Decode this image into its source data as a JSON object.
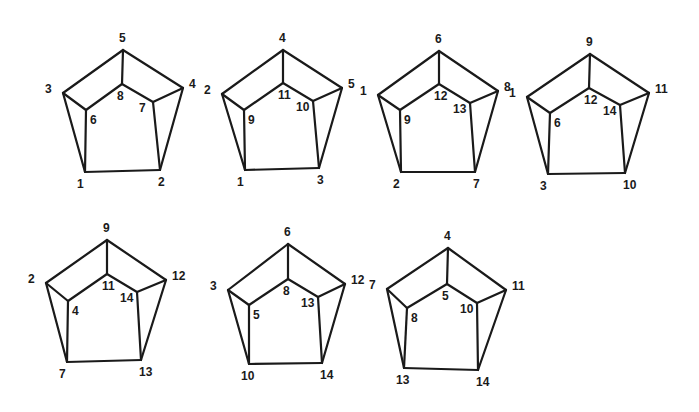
{
  "diagram": {
    "vertex_roles": [
      "top",
      "left",
      "right",
      "inner_top",
      "inner_left",
      "inner_right",
      "bottom_left",
      "bottom_right"
    ],
    "edges": [
      [
        "top",
        "left"
      ],
      [
        "top",
        "right"
      ],
      [
        "top",
        "inner_top"
      ],
      [
        "left",
        "inner_left"
      ],
      [
        "right",
        "inner_right"
      ],
      [
        "inner_top",
        "inner_left"
      ],
      [
        "inner_top",
        "inner_right"
      ],
      [
        "left",
        "bottom_left"
      ],
      [
        "inner_left",
        "bottom_left"
      ],
      [
        "right",
        "bottom_right"
      ],
      [
        "inner_right",
        "bottom_right"
      ],
      [
        "bottom_left",
        "bottom_right"
      ]
    ],
    "figures": [
      {
        "id": "fig-1",
        "labels": {
          "top": "5",
          "left": "3",
          "right": "4",
          "inner_top": "8",
          "inner_left": "6",
          "inner_right": "7",
          "bottom_left": "1",
          "bottom_right": "2"
        },
        "pts": {
          "top": [
            123,
            50
          ],
          "left": [
            63,
            93
          ],
          "right": [
            183,
            88
          ],
          "inner_top": [
            122,
            84
          ],
          "inner_left": [
            86,
            110
          ],
          "inner_right": [
            153,
            102
          ],
          "bottom_left": [
            85,
            172
          ],
          "bottom_right": [
            160,
            170
          ]
        }
      },
      {
        "id": "fig-2",
        "labels": {
          "top": "4",
          "left": "2",
          "right": "5",
          "inner_top": "11",
          "inner_left": "9",
          "inner_right": "10",
          "bottom_left": "1",
          "bottom_right": "3"
        },
        "pts": {
          "top": [
            283,
            50
          ],
          "left": [
            222,
            94
          ],
          "right": [
            342,
            88
          ],
          "inner_top": [
            283,
            83
          ],
          "inner_left": [
            244,
            110
          ],
          "inner_right": [
            313,
            101
          ],
          "bottom_left": [
            245,
            170
          ],
          "bottom_right": [
            319,
            168
          ]
        }
      },
      {
        "id": "fig-3",
        "labels": {
          "top": "6",
          "left": "1",
          "right": "8",
          "inner_top": "12",
          "inner_left": "9",
          "inner_right": "13",
          "bottom_left": "2",
          "bottom_right": "7"
        },
        "pts": {
          "top": [
            439,
            51
          ],
          "left": [
            378,
            95
          ],
          "right": [
            498,
            91
          ],
          "inner_top": [
            439,
            84
          ],
          "inner_left": [
            400,
            110
          ],
          "inner_right": [
            470,
            103
          ],
          "bottom_left": [
            401,
            172
          ],
          "bottom_right": [
            475,
            172
          ]
        }
      },
      {
        "id": "fig-4",
        "labels": {
          "top": "9",
          "left": "1",
          "right": "11",
          "inner_top": "12",
          "inner_left": "6",
          "inner_right": "14",
          "bottom_left": "3",
          "bottom_right": "10"
        },
        "pts": {
          "top": [
            590,
            54
          ],
          "left": [
            527,
            97
          ],
          "right": [
            649,
            93
          ],
          "inner_top": [
            589,
            88
          ],
          "inner_left": [
            550,
            113
          ],
          "inner_right": [
            620,
            105
          ],
          "bottom_left": [
            548,
            174
          ],
          "bottom_right": [
            625,
            173
          ]
        }
      },
      {
        "id": "fig-5",
        "labels": {
          "top": "9",
          "left": "2",
          "right": "12",
          "inner_top": "11",
          "inner_left": "4",
          "inner_right": "14",
          "bottom_left": "7",
          "bottom_right": "13"
        },
        "pts": {
          "top": [
            107,
            240
          ],
          "left": [
            46,
            283
          ],
          "right": [
            166,
            280
          ],
          "inner_top": [
            107,
            274
          ],
          "inner_left": [
            68,
            301
          ],
          "inner_right": [
            137,
            292
          ],
          "bottom_left": [
            67,
            362
          ],
          "bottom_right": [
            141,
            360
          ]
        }
      },
      {
        "id": "fig-6",
        "labels": {
          "top": "6",
          "left": "3",
          "right": "12",
          "inner_top": "8",
          "inner_left": "5",
          "inner_right": "13",
          "bottom_left": "10",
          "bottom_right": "14"
        },
        "pts": {
          "top": [
            288,
            244
          ],
          "left": [
            228,
            290
          ],
          "right": [
            345,
            284
          ],
          "inner_top": [
            288,
            279
          ],
          "inner_left": [
            249,
            305
          ],
          "inner_right": [
            318,
            297
          ],
          "bottom_left": [
            249,
            364
          ],
          "bottom_right": [
            322,
            363
          ]
        }
      },
      {
        "id": "fig-7",
        "labels": {
          "top": "4",
          "left": "7",
          "right": "11",
          "inner_top": "5",
          "inner_left": "8",
          "inner_right": "10",
          "bottom_left": "13",
          "bottom_right": "14"
        },
        "pts": {
          "top": [
            448,
            248
          ],
          "left": [
            387,
            289
          ],
          "right": [
            506,
            290
          ],
          "inner_top": [
            447,
            284
          ],
          "inner_left": [
            407,
            308
          ],
          "inner_right": [
            477,
            303
          ],
          "bottom_left": [
            404,
            368
          ],
          "bottom_right": [
            478,
            370
          ]
        }
      }
    ]
  },
  "label_offsets": {
    "top": [
      -4,
      -8
    ],
    "left": [
      -18,
      0
    ],
    "right": [
      6,
      0
    ],
    "inner_top": [
      -5,
      16
    ],
    "inner_left": [
      4,
      14
    ],
    "inner_right": [
      -14,
      10
    ],
    "bottom_left": [
      -8,
      16
    ],
    "bottom_right": [
      -2,
      16
    ]
  }
}
